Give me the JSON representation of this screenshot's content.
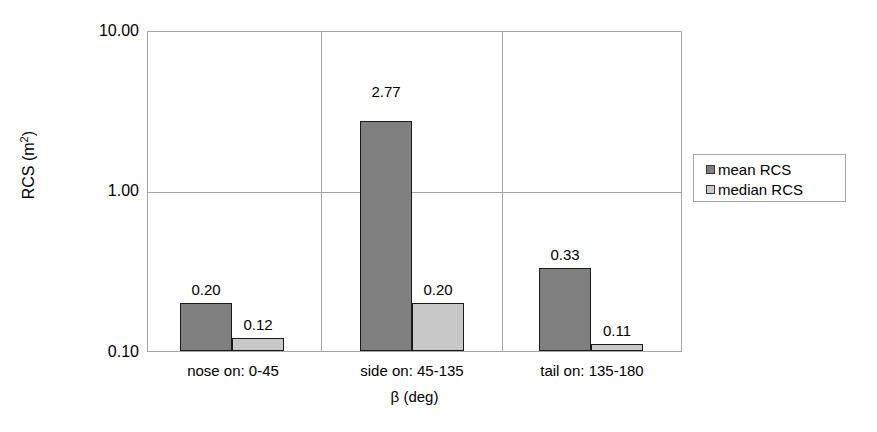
{
  "chart_data": {
    "type": "bar",
    "title": "",
    "xlabel": "β (deg)",
    "ylabel": "RCS (m²)",
    "ylabel_base": "RCS (m",
    "ylabel_sup": "2",
    "ylabel_tail": ")",
    "yscale": "log",
    "ylim": [
      0.1,
      10.0
    ],
    "yticks": [
      "10.00",
      "1.00",
      "0.10"
    ],
    "ytick_values": [
      10.0,
      1.0,
      0.1
    ],
    "grid": true,
    "legend_position": "right",
    "categories": [
      "nose on:  0-45",
      "side on: 45-135",
      "tail on: 135-180"
    ],
    "series": [
      {
        "name": "mean RCS",
        "color": "#808080",
        "values": [
          0.2,
          2.77,
          0.33
        ],
        "labels": [
          "0.20",
          "2.77",
          "0.33"
        ]
      },
      {
        "name": "median RCS",
        "color": "#c8c8c8",
        "values": [
          0.12,
          0.2,
          0.11
        ],
        "labels": [
          "0.12",
          "0.20",
          "0.11"
        ]
      }
    ]
  },
  "legend": {
    "items": [
      {
        "label": "mean RCS"
      },
      {
        "label": "median RCS"
      }
    ]
  },
  "colors": {
    "mean": "#808080",
    "median": "#c8c8c8",
    "axis": "#a6a6a6",
    "bar_border": "#1a1a1a",
    "text": "#000000"
  }
}
